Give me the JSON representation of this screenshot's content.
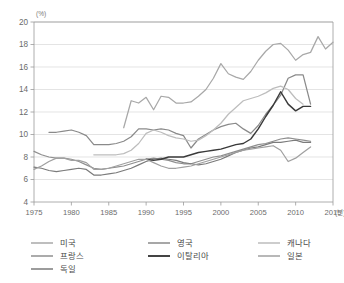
{
  "chart_data": {
    "type": "line",
    "title": "",
    "xlabel": "",
    "ylabel": "",
    "y_unit": "(%)",
    "x_unit": "(년)",
    "xlim": [
      1975,
      2015
    ],
    "ylim": [
      4,
      20
    ],
    "xticks": [
      1975,
      1980,
      1985,
      1990,
      1995,
      2000,
      2005,
      2010,
      2015
    ],
    "yticks": [
      4,
      6,
      8,
      10,
      12,
      14,
      16,
      18,
      20
    ],
    "grid": "horizontal",
    "legend_position": "bottom",
    "series": [
      {
        "name": "미국",
        "color": "#a8a8a8",
        "width": 1.25,
        "x": [
          1987,
          1988,
          1989,
          1990,
          1991,
          1992,
          1993,
          1994,
          1995,
          1996,
          1997,
          1998,
          1999,
          2000,
          2001,
          2002,
          2003,
          2004,
          2005,
          2006,
          2007,
          2008,
          2009,
          2010,
          2011,
          2012,
          2013,
          2014,
          2015
        ],
        "values": [
          10.6,
          13.0,
          12.8,
          13.3,
          12.2,
          13.4,
          13.3,
          12.8,
          12.8,
          12.9,
          13.4,
          14.0,
          15.0,
          16.3,
          15.4,
          15.1,
          14.9,
          15.6,
          16.6,
          17.4,
          18.0,
          18.1,
          17.5,
          16.6,
          17.1,
          17.3,
          18.7,
          17.6,
          18.2
        ]
      },
      {
        "name": "프랑스",
        "color": "#8f8f8f",
        "width": 1.25,
        "x": [
          1975,
          1976,
          1977,
          1978,
          1979,
          1980,
          1981,
          1982,
          1983,
          1984,
          1985,
          1986,
          1987,
          1988,
          1989,
          1990,
          1991,
          1992,
          1993,
          1994,
          1995,
          1996,
          1997,
          1998,
          1999,
          2000,
          2001,
          2002,
          2003,
          2004,
          2005,
          2006,
          2007,
          2008,
          2009,
          2010,
          2011,
          2012
        ],
        "values": [
          8.5,
          8.2,
          8.0,
          7.9,
          7.9,
          7.8,
          7.6,
          7.3,
          7.0,
          6.9,
          7.0,
          7.1,
          7.2,
          7.4,
          7.6,
          7.8,
          7.9,
          7.8,
          7.7,
          7.5,
          7.4,
          7.4,
          7.6,
          7.8,
          8.0,
          8.1,
          8.3,
          8.5,
          8.7,
          8.9,
          9.1,
          9.2,
          9.4,
          9.6,
          9.7,
          9.6,
          9.5,
          9.4
        ]
      },
      {
        "name": "독일",
        "color": "#7b7b7b",
        "width": 1.25,
        "x": [
          1975,
          1976,
          1977,
          1978,
          1979,
          1980,
          1981,
          1982,
          1983,
          1984,
          1985,
          1986,
          1987,
          1988,
          1989,
          1990,
          1991,
          1992,
          1993,
          1994,
          1995,
          1996,
          1997,
          1998,
          1999,
          2000,
          2001,
          2002,
          2003,
          2004,
          2005,
          2006,
          2007,
          2008,
          2009,
          2010,
          2011,
          2012
        ],
        "values": [
          7.1,
          7.0,
          6.8,
          6.7,
          6.8,
          6.9,
          7.0,
          6.9,
          6.4,
          6.4,
          6.5,
          6.6,
          6.8,
          7.0,
          7.3,
          7.6,
          7.8,
          7.9,
          7.8,
          7.7,
          7.5,
          7.4,
          7.3,
          7.4,
          7.6,
          7.8,
          8.1,
          8.4,
          8.6,
          8.8,
          8.9,
          9.1,
          9.3,
          9.3,
          9.4,
          9.5,
          9.3,
          9.3
        ]
      },
      {
        "name": "영국",
        "color": "#8a8a8a",
        "width": 1.25,
        "x": [
          1977,
          1978,
          1979,
          1980,
          1981,
          1982,
          1983,
          1984,
          1985,
          1986,
          1987,
          1988,
          1989,
          1990,
          1991,
          1992,
          1993,
          1994,
          1995,
          1996,
          1997,
          1998,
          1999,
          2000,
          2001,
          2002,
          2003,
          2004,
          2005,
          2006,
          2007,
          2008,
          2009,
          2010,
          2011,
          2012
        ],
        "values": [
          10.2,
          10.2,
          10.3,
          10.4,
          10.2,
          9.9,
          9.1,
          9.1,
          9.1,
          9.2,
          9.4,
          9.8,
          10.5,
          10.5,
          10.4,
          10.5,
          10.4,
          10.1,
          9.9,
          8.8,
          9.6,
          10.0,
          10.4,
          10.7,
          10.9,
          11.0,
          10.5,
          10.1,
          10.8,
          11.8,
          12.6,
          13.5,
          15.0,
          15.3,
          15.3,
          12.7
        ]
      },
      {
        "name": "이탈리아",
        "color": "#3a3a3a",
        "width": 1.45,
        "x": [
          1990,
          1991,
          1992,
          1993,
          1994,
          1995,
          1996,
          1997,
          1998,
          1999,
          2000,
          2001,
          2002,
          2003,
          2004,
          2005,
          2006,
          2007,
          2008,
          2009,
          2010,
          2011,
          2012
        ],
        "values": [
          7.8,
          7.7,
          7.8,
          8.0,
          8.0,
          8.0,
          8.2,
          8.4,
          8.5,
          8.6,
          8.7,
          8.9,
          9.1,
          9.2,
          9.6,
          10.5,
          11.6,
          12.6,
          13.8,
          12.7,
          12.1,
          12.5,
          12.5
        ]
      },
      {
        "name": "캐나다",
        "color": "#bdbdbd",
        "width": 1.25,
        "x": [
          1983,
          1984,
          1985,
          1986,
          1987,
          1988,
          1989,
          1990,
          1991,
          1992,
          1993,
          1994,
          1995,
          1996,
          1997,
          1998,
          1999,
          2000,
          2001,
          2002,
          2003,
          2004,
          2005,
          2006,
          2007,
          2008,
          2009,
          2010,
          2011
        ],
        "values": [
          8.2,
          8.2,
          8.2,
          8.2,
          8.3,
          8.6,
          9.2,
          10.1,
          10.4,
          10.2,
          9.9,
          9.7,
          9.6,
          9.4,
          9.5,
          9.9,
          10.4,
          11.0,
          11.8,
          12.4,
          13.0,
          13.2,
          13.4,
          13.7,
          14.1,
          14.3,
          14.0,
          13.2,
          12.7
        ]
      },
      {
        "name": "일본",
        "color": "#a0a0a0",
        "width": 1.25,
        "x": [
          1975,
          1976,
          1977,
          1978,
          1979,
          1980,
          1981,
          1982,
          1983,
          1984,
          1985,
          1986,
          1987,
          1988,
          1989,
          1990,
          1991,
          1992,
          1993,
          1994,
          1995,
          1996,
          1997,
          1998,
          1999,
          2000,
          2001,
          2002,
          2003,
          2004,
          2005,
          2006,
          2007,
          2008,
          2009,
          2010,
          2011,
          2012
        ],
        "values": [
          6.9,
          7.2,
          7.6,
          7.9,
          7.9,
          7.7,
          7.7,
          7.5,
          6.9,
          6.9,
          7.0,
          7.2,
          7.4,
          7.6,
          7.8,
          7.8,
          7.5,
          7.2,
          7.0,
          7.0,
          7.1,
          7.2,
          7.4,
          7.6,
          7.8,
          8.0,
          8.2,
          8.4,
          8.6,
          8.7,
          8.8,
          8.9,
          9.0,
          8.6,
          7.6,
          7.9,
          8.4,
          8.9
        ]
      }
    ]
  },
  "legend": {
    "items": [
      {
        "label": "미국",
        "color": "#a8a8a8"
      },
      {
        "label": "영국",
        "color": "#8a8a8a"
      },
      {
        "label": "캐나다",
        "color": "#bdbdbd"
      },
      {
        "label": "프랑스",
        "color": "#8f8f8f"
      },
      {
        "label": "이탈리아",
        "color": "#3a3a3a"
      },
      {
        "label": "일본",
        "color": "#a0a0a0"
      },
      {
        "label": "독일",
        "color": "#7b7b7b"
      }
    ]
  }
}
